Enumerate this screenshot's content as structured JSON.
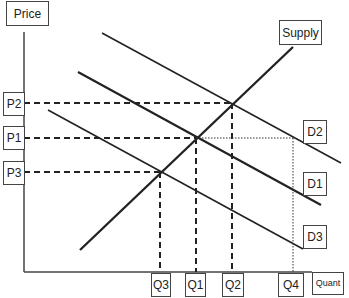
{
  "diagram": {
    "axes": {
      "y_label": "Price",
      "x_label": "Quant"
    },
    "curves": {
      "supply": "Supply",
      "demand": [
        "D2",
        "D1",
        "D3"
      ]
    },
    "price_levels": [
      "P2",
      "P1",
      "P3"
    ],
    "quantity_levels": [
      "Q3",
      "Q1",
      "Q2",
      "Q4"
    ],
    "colors": {
      "line": "#222222",
      "box_border": "#444444",
      "background": "#ffffff"
    }
  }
}
